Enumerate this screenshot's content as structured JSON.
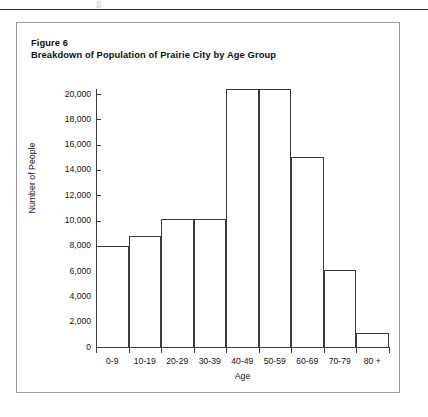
{
  "page": {
    "artifact_text": "g",
    "rule": "horizontal-rule"
  },
  "figure": {
    "caption_line1": "Figure 6",
    "caption_line2": "Breakdown of Population of Prairie City by Age Group"
  },
  "chart_data": {
    "type": "bar",
    "title": "Breakdown of Population of Prairie City by Age Group",
    "subtitle": "Figure 6",
    "xlabel": "Age",
    "ylabel": "Number of People",
    "categories": [
      "0-9",
      "10-19",
      "20-29",
      "30-39",
      "40-49",
      "50-59",
      "60-69",
      "70-79",
      "80 +"
    ],
    "values": [
      8000,
      8800,
      10100,
      10100,
      20400,
      20400,
      15000,
      6100,
      1100
    ],
    "ylim": [
      0,
      20400
    ],
    "ytick_values": [
      0,
      2000,
      4000,
      6000,
      8000,
      10000,
      12000,
      14000,
      16000,
      18000,
      20000
    ],
    "ytick_labels": [
      "0",
      "2,000",
      "4,000",
      "6,000",
      "8,000",
      "10,000",
      "12,000",
      "14,000",
      "16,000",
      "18,000",
      "20,000"
    ],
    "grid": false,
    "legend": null,
    "bar_style": "outlined-white-adjacent",
    "colors": {
      "bar_fill": "#ffffff",
      "bar_outline": "#3a3a3a",
      "axis": "#3a3a3a",
      "text": "#111111",
      "frame": "#9a9a9a"
    }
  }
}
